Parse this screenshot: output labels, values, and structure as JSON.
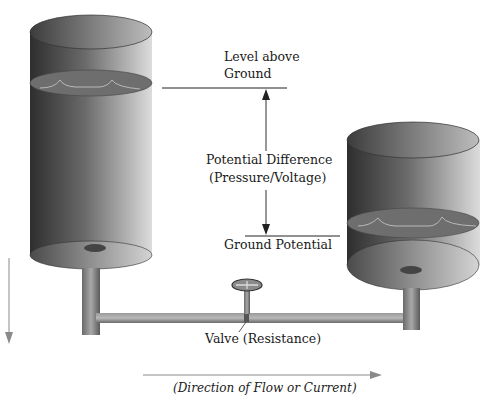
{
  "diagram": {
    "labels": {
      "level_line1": "Level above",
      "level_line2": "Ground",
      "potential_line1": "Potential Difference",
      "potential_line2": "(Pressure/Voltage)",
      "ground": "Ground Potential",
      "valve": "Valve (Resistance)",
      "flow": "(Direction of Flow or Current)"
    },
    "colors": {
      "tank_dark": "#3a3a3a",
      "tank_light": "#d8d8d8",
      "water_surface": "#6e6e6e",
      "ripple": "#b8b8b8",
      "line": "#222222",
      "arrow_gray": "#8a8a8a"
    }
  }
}
